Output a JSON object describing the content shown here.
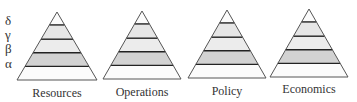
{
  "axis_levels": [
    {
      "symbol": "δ",
      "y": 14
    },
    {
      "symbol": "γ",
      "y": 28
    },
    {
      "symbol": "β",
      "y": 42
    },
    {
      "symbol": "α",
      "y": 57
    }
  ],
  "colors": {
    "stroke": "#555555",
    "band_line": "#222222",
    "band_light": "#ececec",
    "band_mid": "#e6e6e6",
    "band_dark": "#d2d2d2",
    "band_white": "#fbfbfb"
  },
  "pyramids": [
    {
      "label": "Resources",
      "apex_x": 57,
      "apex_y": 12,
      "base_y": 80,
      "half_width": 40,
      "label_x": 12,
      "label_y": 86
    },
    {
      "label": "Operations",
      "apex_x": 142,
      "apex_y": 11,
      "base_y": 79,
      "half_width": 39,
      "label_x": 97,
      "label_y": 85
    },
    {
      "label": "Policy",
      "apex_x": 227,
      "apex_y": 10,
      "base_y": 78,
      "half_width": 39,
      "label_x": 182,
      "label_y": 84
    },
    {
      "label": "Economics",
      "apex_x": 309,
      "apex_y": 9,
      "base_y": 77,
      "half_width": 39,
      "label_x": 264,
      "label_y": 82
    }
  ],
  "band_fractions": [
    0.19,
    0.4,
    0.6,
    0.8
  ]
}
